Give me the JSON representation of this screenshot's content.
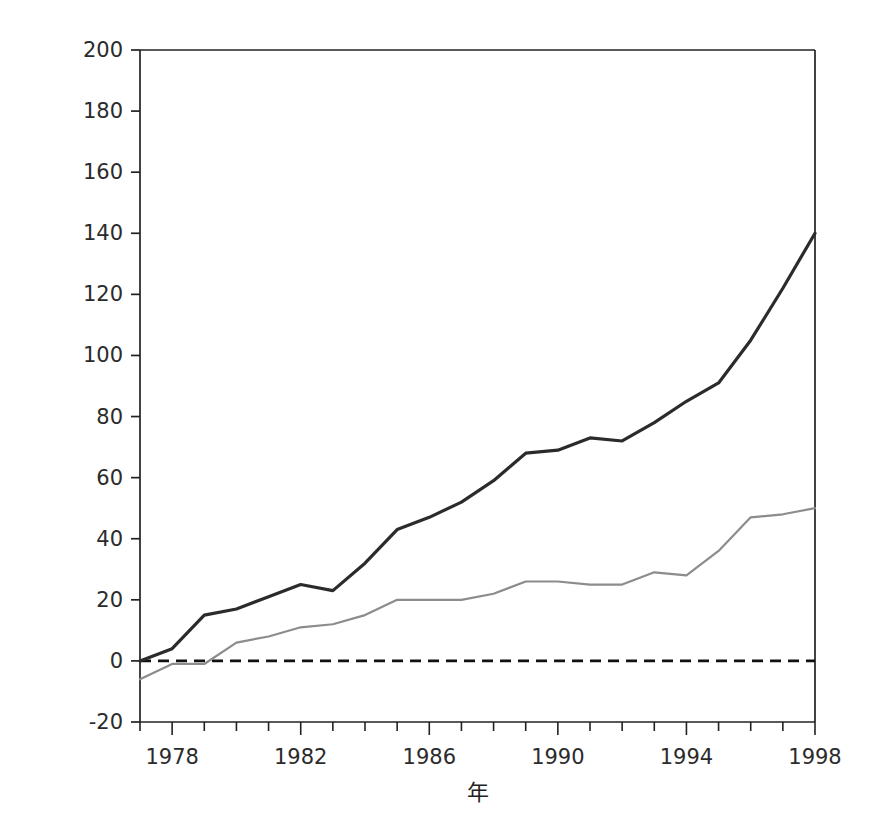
{
  "chart_data": {
    "type": "line",
    "title": "",
    "xlabel": "年",
    "ylabel": "累計觀測值減去期望值的死亡人數",
    "xlim": [
      1977,
      1998
    ],
    "ylim": [
      -20,
      200
    ],
    "grid": false,
    "legend_position": "top-left",
    "x": [
      1977,
      1978,
      1979,
      1980,
      1981,
      1982,
      1983,
      1984,
      1985,
      1986,
      1987,
      1988,
      1989,
      1990,
      1991,
      1992,
      1993,
      1994,
      1995,
      1996,
      1997,
      1998
    ],
    "xtick_labels": [
      "1978",
      "1982",
      "1986",
      "1990",
      "1994",
      "1998"
    ],
    "xtick_values": [
      1978,
      1982,
      1986,
      1990,
      1994,
      1998
    ],
    "ytick_labels": [
      "-20",
      "0",
      "20",
      "40",
      "60",
      "80",
      "100",
      "120",
      "140",
      "160",
      "180",
      "200"
    ],
    "ytick_values": [
      -20,
      0,
      20,
      40,
      60,
      80,
      100,
      120,
      140,
      160,
      180,
      200
    ],
    "reference_line": {
      "value": 0,
      "style": "dashed",
      "color": "#111111"
    },
    "series": [
      {
        "name": "女性",
        "color": "#2b2b2b",
        "width": 3.2,
        "values": [
          0,
          4,
          15,
          17,
          21,
          25,
          23,
          32,
          43,
          47,
          52,
          59,
          68,
          69,
          73,
          72,
          78,
          85,
          91,
          105,
          122,
          140
        ]
      },
      {
        "name": "男性",
        "color": "#8c8c8c",
        "width": 2.2,
        "values": [
          -6,
          -1,
          -1,
          6,
          8,
          11,
          12,
          15,
          20,
          20,
          20,
          22,
          26,
          26,
          25,
          25,
          29,
          28,
          36,
          47,
          48,
          50
        ]
      }
    ]
  },
  "axes": {
    "y_label_chars": [
      "累",
      "計",
      "觀",
      "測",
      "值",
      "減",
      "去",
      "期",
      "望",
      "值",
      "的",
      "死",
      "亡",
      "人",
      "數"
    ],
    "x_label": "年"
  },
  "legend": {
    "items": [
      {
        "label": "女性",
        "color": "#2b2b2b"
      },
      {
        "label": "男性",
        "color": "#8c8c8c"
      }
    ]
  }
}
